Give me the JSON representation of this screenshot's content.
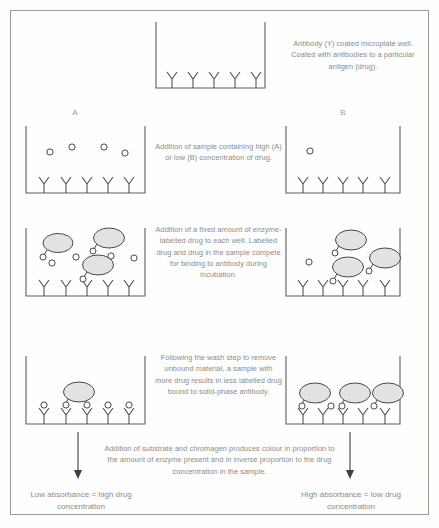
{
  "diagram": {
    "title_present": false,
    "type": "competitive-elisa-schematic",
    "labels": {
      "well_a": "A",
      "well_b": "B"
    },
    "captions": {
      "step1": "Antibody (Y) coated microplate well. Coated with antibodies to a particular antigen (drug).",
      "step2": "Addition of sample containing high (A) or low (B) concentration of drug.",
      "step3": "Addition of a fixed amount of enzyme-labelled drug to each well. Labelled drug and drug in the sample compete for binding to antibody during incubation.",
      "step4": "Following the wash step to remove unbound material, a sample with more drug results in less labelled drug bound to solid-phase antibody.",
      "step5": "Addition of substrate and chromagen produces colour in proportion to the amount of enzyme present and in inverse proportion to the drug concentration in the sample."
    },
    "results": {
      "left": "Low absorbance = high drug concentration",
      "right": "High absorbance = low drug concentration"
    },
    "colors": {
      "outline": "#5d5d5d",
      "enzyme_fill": "#e2e2e2",
      "drug_fill": "#fbfbfb",
      "caption_text": "#8b8b88",
      "frame": "#9a9a96"
    },
    "rows": [
      {
        "row": 1,
        "name": "coated-well",
        "wells": [
          {
            "id": "top",
            "antibodies": 5,
            "free_drug": 0,
            "labelled_drug": 0,
            "bound_labelled_drug": 0,
            "bound_drug": 0
          }
        ]
      },
      {
        "row": 2,
        "name": "sample-addition",
        "wells": [
          {
            "id": "A",
            "antibodies": 5,
            "free_drug": 4,
            "labelled_drug": 0
          },
          {
            "id": "B",
            "antibodies": 5,
            "free_drug": 1,
            "labelled_drug": 0
          }
        ]
      },
      {
        "row": 3,
        "name": "labelled-drug-competition",
        "wells": [
          {
            "id": "A",
            "antibodies": 5,
            "free_drug": 5,
            "labelled_drug": 3
          },
          {
            "id": "B",
            "antibodies": 5,
            "free_drug": 1,
            "labelled_drug": 3
          }
        ]
      },
      {
        "row": 4,
        "name": "post-wash-bound",
        "wells": [
          {
            "id": "A",
            "antibodies": 5,
            "bound_labelled_drug": 1,
            "bound_drug": 4
          },
          {
            "id": "B",
            "antibodies": 5,
            "bound_labelled_drug": 3,
            "bound_drug": 2
          }
        ]
      }
    ]
  }
}
